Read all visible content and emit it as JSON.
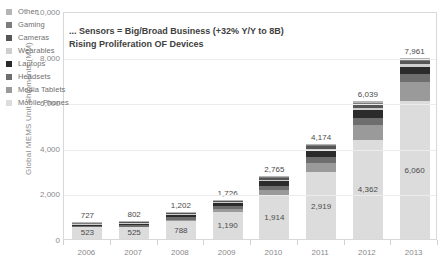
{
  "chart_data": {
    "type": "bar",
    "title": "... Sensors = Big/Broad Business (+32% Y/Y to 8B)",
    "subtitle": "Rising Proliferation OF Devices",
    "xlabel": "",
    "ylabel": "Global MEMS Unit Shipments (MM)",
    "ylim": [
      0,
      10000
    ],
    "yticks": [
      "0",
      "2,000",
      "4,000",
      "6,000",
      "8,000",
      "10,000"
    ],
    "ytick_values": [
      0,
      2000,
      4000,
      6000,
      8000,
      10000
    ],
    "grid": true,
    "stacked": true,
    "legend_position": "top-left",
    "categories": [
      "2006",
      "2007",
      "2008",
      "2009",
      "2010",
      "2011",
      "2012",
      "2013"
    ],
    "series": [
      {
        "name": "Mobile Phones",
        "color": "#dcdcdc",
        "values": [
          523,
          525,
          788,
          1190,
          1914,
          2919,
          4362,
          6060
        ]
      },
      {
        "name": "Media Tablets",
        "color": "#9a9a9a",
        "values": [
          0,
          0,
          30,
          120,
          230,
          430,
          650,
          830
        ]
      },
      {
        "name": "Headsets",
        "color": "#6e6e6e",
        "values": [
          60,
          80,
          130,
          150,
          200,
          250,
          300,
          330
        ]
      },
      {
        "name": "Laptops",
        "color": "#2b2b2b",
        "values": [
          70,
          90,
          120,
          140,
          200,
          300,
          350,
          330
        ]
      },
      {
        "name": "Wearables",
        "color": "#cfcfcf",
        "values": [
          10,
          15,
          30,
          35,
          45,
          60,
          90,
          130
        ]
      },
      {
        "name": "Cameras",
        "color": "#565656",
        "values": [
          30,
          45,
          50,
          45,
          80,
          105,
          127,
          131
        ]
      },
      {
        "name": "Gaming",
        "color": "#7d7d7d",
        "values": [
          24,
          32,
          38,
          26,
          56,
          70,
          90,
          96
        ]
      },
      {
        "name": "Other",
        "color": "#b5b5b5",
        "values": [
          10,
          15,
          16,
          20,
          40,
          40,
          70,
          54
        ]
      }
    ],
    "totals": [
      727,
      802,
      1202,
      1726,
      2765,
      4174,
      6039,
      7961
    ],
    "total_labels": [
      "727",
      "802",
      "1,202",
      "1,726",
      "2,765",
      "4,174",
      "6,039",
      "7,961"
    ],
    "inner_labels": [
      "523",
      "525",
      "788",
      "1,190",
      "1,914",
      "2,919",
      "4,362",
      "6,060"
    ],
    "legend_order": [
      "Other",
      "Gaming",
      "Cameras",
      "Wearables",
      "Laptops",
      "Headsets",
      "Media Tablets",
      "Mobile Phones"
    ]
  },
  "legend": {
    "items": [
      {
        "label": "Other",
        "color": "#b5b5b5"
      },
      {
        "label": "Gaming",
        "color": "#7d7d7d"
      },
      {
        "label": "Cameras",
        "color": "#565656"
      },
      {
        "label": "Wearables",
        "color": "#cfcfcf"
      },
      {
        "label": "Laptops",
        "color": "#2b2b2b"
      },
      {
        "label": "Headsets",
        "color": "#6e6e6e"
      },
      {
        "label": "Media Tablets",
        "color": "#9a9a9a"
      },
      {
        "label": "Mobile Phones",
        "color": "#dcdcdc"
      }
    ]
  }
}
